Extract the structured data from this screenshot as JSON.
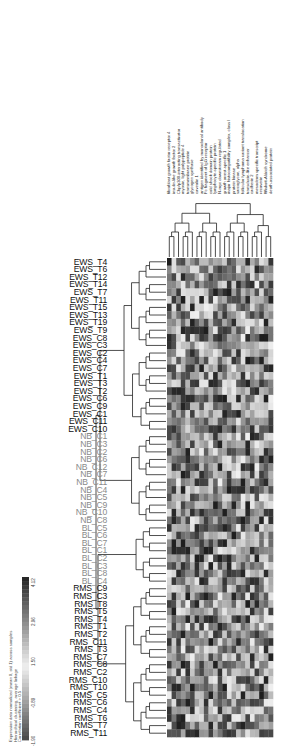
{
  "chart_data": {
    "type": "heatmap",
    "title": "",
    "xlabel": "Genes (hierarchically clustered)",
    "ylabel": "Samples (hierarchically clustered)",
    "orientation": "rotated-90",
    "rows": [
      {
        "label": "EWS_T4",
        "group": "EWS"
      },
      {
        "label": "EWS_T6",
        "group": "EWS"
      },
      {
        "label": "EWS_T12",
        "group": "EWS"
      },
      {
        "label": "EWS_T14",
        "group": "EWS"
      },
      {
        "label": "EWS_T7",
        "group": "EWS"
      },
      {
        "label": "EWS_T11",
        "group": "EWS"
      },
      {
        "label": "EWS_T15",
        "group": "EWS"
      },
      {
        "label": "EWS_T13",
        "group": "EWS"
      },
      {
        "label": "EWS_T19",
        "group": "EWS"
      },
      {
        "label": "EWS_T9",
        "group": "EWS"
      },
      {
        "label": "EWS_C8",
        "group": "EWS"
      },
      {
        "label": "EWS_C3",
        "group": "EWS"
      },
      {
        "label": "EWS_C2",
        "group": "EWS"
      },
      {
        "label": "EWS_C4",
        "group": "EWS"
      },
      {
        "label": "EWS_C7",
        "group": "EWS"
      },
      {
        "label": "EWS_T1",
        "group": "EWS"
      },
      {
        "label": "EWS_T3",
        "group": "EWS"
      },
      {
        "label": "EWS_T2",
        "group": "EWS"
      },
      {
        "label": "EWS_C6",
        "group": "EWS"
      },
      {
        "label": "EWS_C9",
        "group": "EWS"
      },
      {
        "label": "EWS_C1",
        "group": "EWS"
      },
      {
        "label": "EWS_C11",
        "group": "EWS"
      },
      {
        "label": "EWS_C10",
        "group": "EWS"
      },
      {
        "label": "NB_C1",
        "group": "NB"
      },
      {
        "label": "NB_C3",
        "group": "NB"
      },
      {
        "label": "NB_C2",
        "group": "NB"
      },
      {
        "label": "NB_C6",
        "group": "NB"
      },
      {
        "label": "NB_C12",
        "group": "NB"
      },
      {
        "label": "NB_C7",
        "group": "NB"
      },
      {
        "label": "NB_C11",
        "group": "NB"
      },
      {
        "label": "NB_C4",
        "group": "NB"
      },
      {
        "label": "NB_C5",
        "group": "NB"
      },
      {
        "label": "NB_C9",
        "group": "NB"
      },
      {
        "label": "NB_C10",
        "group": "NB"
      },
      {
        "label": "NB_C8",
        "group": "NB"
      },
      {
        "label": "BL_C5",
        "group": "BL"
      },
      {
        "label": "BL_C6",
        "group": "BL"
      },
      {
        "label": "BL_C7",
        "group": "BL"
      },
      {
        "label": "BL_C1",
        "group": "BL"
      },
      {
        "label": "BL_C2",
        "group": "BL"
      },
      {
        "label": "BL_C3",
        "group": "BL"
      },
      {
        "label": "BL_C8",
        "group": "BL"
      },
      {
        "label": "BL_C4",
        "group": "BL"
      },
      {
        "label": "RMS_C9",
        "group": "RMS"
      },
      {
        "label": "RMS_C3",
        "group": "RMS"
      },
      {
        "label": "RMS_T8",
        "group": "RMS"
      },
      {
        "label": "RMS_T5",
        "group": "RMS"
      },
      {
        "label": "RMS_T4",
        "group": "RMS"
      },
      {
        "label": "RMS_T1",
        "group": "RMS"
      },
      {
        "label": "RMS_T2",
        "group": "RMS"
      },
      {
        "label": "RMS_C11",
        "group": "RMS"
      },
      {
        "label": "RMS_T3",
        "group": "RMS"
      },
      {
        "label": "RMS_C7",
        "group": "RMS"
      },
      {
        "label": "RMS_C8",
        "group": "RMS"
      },
      {
        "label": "RMS_C2",
        "group": "RMS"
      },
      {
        "label": "RMS_C10",
        "group": "RMS"
      },
      {
        "label": "RMS_T10",
        "group": "RMS"
      },
      {
        "label": "RMS_C5",
        "group": "RMS"
      },
      {
        "label": "RMS_C6",
        "group": "RMS"
      },
      {
        "label": "RMS_C4",
        "group": "RMS"
      },
      {
        "label": "RMS_T6",
        "group": "RMS"
      },
      {
        "label": "RMS_T7",
        "group": "RMS"
      },
      {
        "label": "RMS_T11",
        "group": "RMS"
      }
    ],
    "group_colors": {
      "EWS": "#111111",
      "NB": "#8a8a8a",
      "BL": "#8a8a8a",
      "RMS": "#111111"
    },
    "n_columns": 23,
    "columns": [
      "fibroblast growth factor receptor 4",
      "insulin-like growth factor 2",
      "Cbp/p300-interacting transactivator",
      "myosin, light polypeptide 4",
      "transmembrane protein",
      "glycogen synthase",
      "caveolin 1",
      "antigen identified by monoclonal antibody",
      "Fc fragment of IgG receptor",
      "cold shock domain protein",
      "lymphocyte-specific protein",
      "N-myc downstream regulated",
      "growth arrest-specific 1",
      "major histocompatibility complex, class I",
      "protein kinase",
      "sarcoglycan, alpha",
      "follicular lymphoma variant translocation",
      "transducin-like enhancer",
      "cadherin 2",
      "mesoderm specific transcript",
      "recoverin",
      "Wiskott-Aldrich syndrome",
      "death-associated protein"
    ],
    "color_scale": {
      "min": -1.9,
      "max": 4.12,
      "ticks": [
        "-1.90",
        "-0.89",
        "1.50",
        "2.96",
        "4.12"
      ],
      "low_color": "#1a1a1a",
      "mid_color": "#f4f4f4",
      "high_color": "#1a1a1a"
    },
    "legend_caption": [
      "Expression data normalized (mean 0, std 1) across samples",
      "Hierarchical clustering, average linkage",
      "Correlation coefficient > 0.5"
    ],
    "legend_position": "bottom-left"
  }
}
